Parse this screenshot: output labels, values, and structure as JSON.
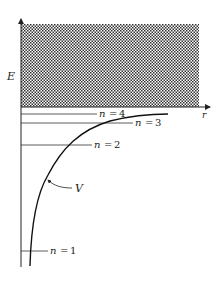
{
  "diagram": {
    "axes": {
      "y_label": "E",
      "x_label": "r"
    },
    "continuum_region": {
      "pattern": "crosshatch",
      "color": "#333333"
    },
    "curve": {
      "label": "V"
    },
    "levels": [
      {
        "n_label": "n",
        "eq": "=",
        "value": "4"
      },
      {
        "n_label": "n",
        "eq": "=",
        "value": "3"
      },
      {
        "n_label": "n",
        "eq": "=",
        "value": "2"
      },
      {
        "n_label": "n",
        "eq": "=",
        "value": "1"
      }
    ],
    "colors": {
      "ink": "#222222",
      "background": "#ffffff"
    }
  }
}
